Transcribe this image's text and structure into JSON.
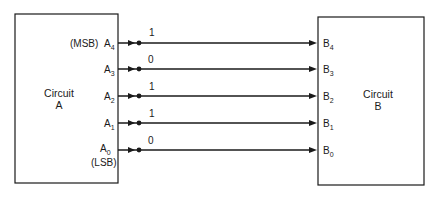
{
  "circuit_a": {
    "title": "Circuit",
    "name": "A"
  },
  "circuit_b": {
    "title": "Circuit",
    "name": "B"
  },
  "msb_label": "(MSB)",
  "lsb_label": "(LSB)",
  "lines": [
    {
      "out": "A",
      "out_sub": "4",
      "in": "B",
      "in_sub": "4",
      "bit": "1",
      "y": 43
    },
    {
      "out": "A",
      "out_sub": "3",
      "in": "B",
      "in_sub": "3",
      "bit": "0",
      "y": 69
    },
    {
      "out": "A",
      "out_sub": "2",
      "in": "B",
      "in_sub": "2",
      "bit": "1",
      "y": 96
    },
    {
      "out": "A",
      "out_sub": "1",
      "in": "B",
      "in_sub": "1",
      "bit": "1",
      "y": 123
    },
    {
      "out": "A",
      "out_sub": "0",
      "in": "B",
      "in_sub": "0",
      "bit": "0",
      "y": 150
    }
  ],
  "colors": {
    "stroke": "#1a1a1a",
    "background": "#ffffff"
  }
}
